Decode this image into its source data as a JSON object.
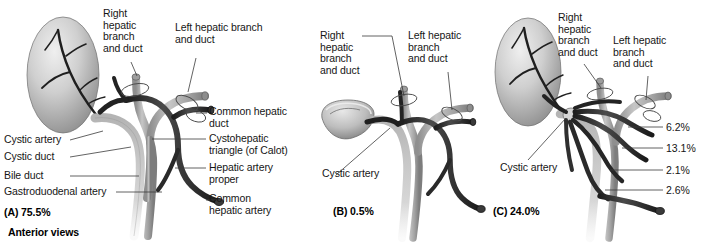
{
  "figure": {
    "title_caption": "Anterior views",
    "panels": [
      {
        "id": "A",
        "caption": "(A) 75.5%",
        "labels": {
          "right_hepatic": "Right\nhepatic\nbranch\nand duct",
          "left_hepatic": "Left hepatic branch\nand duct",
          "common_hepatic_duct": "Common hepatic\nduct",
          "cystohepatic_triangle": "Cystohepatic\ntriangle (of Calot)",
          "hepatic_artery_proper": "Hepatic artery\nproper",
          "common_hepatic_artery": "Common\nhepatic artery",
          "cystic_artery": "Cystic artery",
          "cystic_duct": "Cystic duct",
          "bile_duct": "Bile duct",
          "gastroduodenal_artery": "Gastroduodenal artery"
        }
      },
      {
        "id": "B",
        "caption": "(B) 0.5%",
        "labels": {
          "right_hepatic": "Right\nhepatic\nbranch\nand duct",
          "left_hepatic": "Left hepatic\nbranch\nand duct",
          "cystic_artery": "Cystic artery"
        }
      },
      {
        "id": "C",
        "caption": "(C) 24.0%",
        "labels": {
          "right_hepatic": "Right\nhepatic\nbranch\nand duct",
          "left_hepatic": "Left hepatic\nbranch\nand duct",
          "cystic_artery": "Cystic artery"
        },
        "percentages": [
          "6.2%",
          "13.1%",
          "2.1%",
          "2.6%"
        ]
      }
    ]
  },
  "colors": {
    "background": "#ffffff",
    "text": "#161616",
    "leader_line": "#3b3b3b",
    "duct_light": "#b9b9b9",
    "duct_mid": "#9a9a9a",
    "artery_dark": "#2c2c2c",
    "gallbladder_light": "#e2e2e2",
    "gallbladder_shadow": "#8e8e8e"
  }
}
